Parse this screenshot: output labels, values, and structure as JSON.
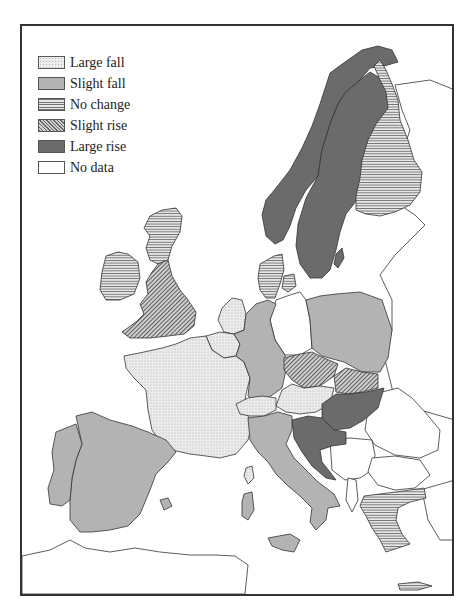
{
  "legend": {
    "items": [
      {
        "key": "large_fall",
        "label": "Large fall",
        "fill": "#ececec",
        "pattern": "stipple"
      },
      {
        "key": "slight_fall",
        "label": "Slight fall",
        "fill": "#b3b3b3",
        "pattern": "solid"
      },
      {
        "key": "no_change",
        "label": "No change",
        "fill": "#e6e6e6",
        "pattern": "horizontal-lines"
      },
      {
        "key": "slight_rise",
        "label": "Slight rise",
        "fill": "#cfcfcf",
        "pattern": "diagonal-hatch"
      },
      {
        "key": "large_rise",
        "label": "Large rise",
        "fill": "#6b6b6b",
        "pattern": "solid"
      },
      {
        "key": "no_data",
        "label": "No data",
        "fill": "#ffffff",
        "pattern": "none"
      }
    ]
  },
  "map": {
    "region": "Europe",
    "countries": [
      {
        "name": "Norway",
        "category": "large_rise"
      },
      {
        "name": "Sweden",
        "category": "large_rise"
      },
      {
        "name": "Finland",
        "category": "no_change"
      },
      {
        "name": "Denmark",
        "category": "no_change"
      },
      {
        "name": "Ireland",
        "category": "no_change"
      },
      {
        "name": "Scotland (UK)",
        "category": "no_change"
      },
      {
        "name": "England & Wales (UK)",
        "category": "slight_rise"
      },
      {
        "name": "Netherlands",
        "category": "large_fall"
      },
      {
        "name": "Belgium",
        "category": "large_fall"
      },
      {
        "name": "France",
        "category": "large_fall"
      },
      {
        "name": "Switzerland",
        "category": "large_fall"
      },
      {
        "name": "Austria",
        "category": "large_fall"
      },
      {
        "name": "West Germany",
        "category": "slight_fall"
      },
      {
        "name": "East Germany",
        "category": "no_data"
      },
      {
        "name": "Poland",
        "category": "slight_fall"
      },
      {
        "name": "Czech lands",
        "category": "slight_rise"
      },
      {
        "name": "Slovakia",
        "category": "slight_rise"
      },
      {
        "name": "Hungary",
        "category": "large_rise"
      },
      {
        "name": "Yugoslavia (Croatia/Slovenia)",
        "category": "large_rise"
      },
      {
        "name": "Italy",
        "category": "slight_fall"
      },
      {
        "name": "Spain",
        "category": "slight_fall"
      },
      {
        "name": "Portugal",
        "category": "slight_fall"
      },
      {
        "name": "Greece",
        "category": "no_change"
      },
      {
        "name": "USSR / Baltic",
        "category": "no_data"
      },
      {
        "name": "Romania",
        "category": "no_data"
      },
      {
        "name": "Bulgaria",
        "category": "no_data"
      },
      {
        "name": "North Africa",
        "category": "no_data"
      },
      {
        "name": "Turkey",
        "category": "no_data"
      }
    ]
  }
}
